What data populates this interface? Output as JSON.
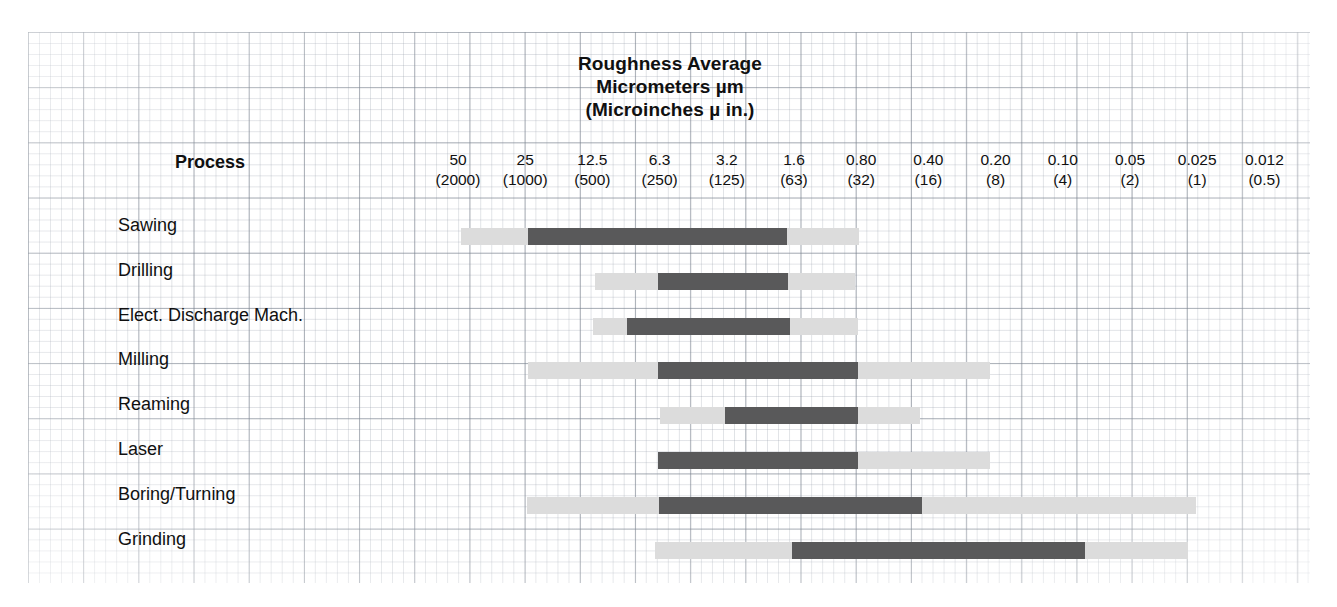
{
  "title": {
    "line1": "Roughness Average",
    "line2": "Micrometers µm",
    "line3": "(Microinches µ in.)"
  },
  "process_header": "Process",
  "colors": {
    "typical_range": "#59595a",
    "less_frequent_range": "#dcdcdc",
    "text": "#101010",
    "grid": "#9aa2ae",
    "paper": "#ffffff"
  },
  "chart_data": {
    "type": "bar",
    "title": "Roughness Average Micrometers µm (Microinches µ in.)",
    "xlabel": "Roughness Average Micrometers µm (Microinches µ in.)",
    "ylabel": "Process",
    "grid": true,
    "legend_position": "none",
    "orientation": "horizontal",
    "note": "Each process has a dark 'typical/average application' span and a lighter 'less frequent application' span. Values are Roughness Average Ra in micrometers; the axis is reversed (coarse at left, fine at right).",
    "axis_ticks_micrometers": [
      50,
      25,
      12.5,
      6.3,
      3.2,
      1.6,
      0.8,
      0.4,
      0.2,
      0.1,
      0.05,
      0.025,
      0.012
    ],
    "axis_ticks_microinches": [
      2000,
      1000,
      500,
      250,
      125,
      63,
      32,
      16,
      8,
      4,
      2,
      1,
      0.5
    ],
    "tick_labels": [
      {
        "micrometers": "50",
        "microinches": "(2000)"
      },
      {
        "micrometers": "25",
        "microinches": "(1000)"
      },
      {
        "micrometers": "12.5",
        "microinches": "(500)"
      },
      {
        "micrometers": "6.3",
        "microinches": "(250)"
      },
      {
        "micrometers": "3.2",
        "microinches": "(125)"
      },
      {
        "micrometers": "1.6",
        "microinches": "(63)"
      },
      {
        "micrometers": "0.80",
        "microinches": "(32)"
      },
      {
        "micrometers": "0.40",
        "microinches": "(16)"
      },
      {
        "micrometers": "0.20",
        "microinches": "(8)"
      },
      {
        "micrometers": "0.10",
        "microinches": "(4)"
      },
      {
        "micrometers": "0.05",
        "microinches": "(2)"
      },
      {
        "micrometers": "0.025",
        "microinches": "(1)"
      },
      {
        "micrometers": "0.012",
        "microinches": "(0.5)"
      }
    ],
    "categories": [
      "Sawing",
      "Drilling",
      "Elect. Discharge Mach.",
      "Milling",
      "Reaming",
      "Laser",
      "Boring/Turning",
      "Grinding"
    ],
    "series": [
      {
        "name": "Less Frequent Application",
        "color": "#dcdcdc",
        "values": [
          {
            "from_um": 50.0,
            "to_um": 0.8
          },
          {
            "from_um": 12.5,
            "to_um": 0.8
          },
          {
            "from_um": 12.5,
            "to_um": 0.8
          },
          {
            "from_um": 25.0,
            "to_um": 0.2
          },
          {
            "from_um": 6.3,
            "to_um": 0.4
          },
          {
            "from_um": 6.3,
            "to_um": 0.2
          },
          {
            "from_um": 25.0,
            "to_um": 0.025
          },
          {
            "from_um": 6.3,
            "to_um": 0.025
          }
        ]
      },
      {
        "name": "Average Application",
        "color": "#59595a",
        "values": [
          {
            "from_um": 25.0,
            "to_um": 1.6
          },
          {
            "from_um": 6.3,
            "to_um": 1.6
          },
          {
            "from_um": 8.0,
            "to_um": 1.6
          },
          {
            "from_um": 6.3,
            "to_um": 0.8
          },
          {
            "from_um": 3.2,
            "to_um": 0.8
          },
          {
            "from_um": 6.3,
            "to_um": 0.8
          },
          {
            "from_um": 6.3,
            "to_um": 0.4
          },
          {
            "from_um": 1.6,
            "to_um": 0.05
          }
        ]
      }
    ]
  },
  "rows": [
    {
      "label": "Sawing",
      "light": {
        "left": 461,
        "width": 398
      },
      "dark": {
        "left": 528,
        "width": 259
      }
    },
    {
      "label": "Drilling",
      "light": {
        "left": 595,
        "width": 260
      },
      "dark": {
        "left": 658,
        "width": 130
      }
    },
    {
      "label": "Elect. Discharge Mach.",
      "light": {
        "left": 593,
        "width": 265
      },
      "dark": {
        "left": 627,
        "width": 163
      }
    },
    {
      "label": "Milling",
      "light": {
        "left": 528,
        "width": 462
      },
      "dark": {
        "left": 658,
        "width": 200
      }
    },
    {
      "label": "Reaming",
      "light": {
        "left": 660,
        "width": 260
      },
      "dark": {
        "left": 725,
        "width": 133
      }
    },
    {
      "label": "Laser",
      "light": {
        "left": 658,
        "width": 332
      },
      "dark": {
        "left": 658,
        "width": 200
      }
    },
    {
      "label": "Boring/Turning",
      "light": {
        "left": 527,
        "width": 669
      },
      "dark": {
        "left": 659,
        "width": 263
      }
    },
    {
      "label": "Grinding",
      "light": {
        "left": 655,
        "width": 533
      },
      "dark": {
        "left": 792,
        "width": 293
      }
    }
  ],
  "layout": {
    "scale_first_center": 458,
    "scale_step": 67.2,
    "row_first_top": 228,
    "row_step": 44.8,
    "label_offset": -13
  }
}
